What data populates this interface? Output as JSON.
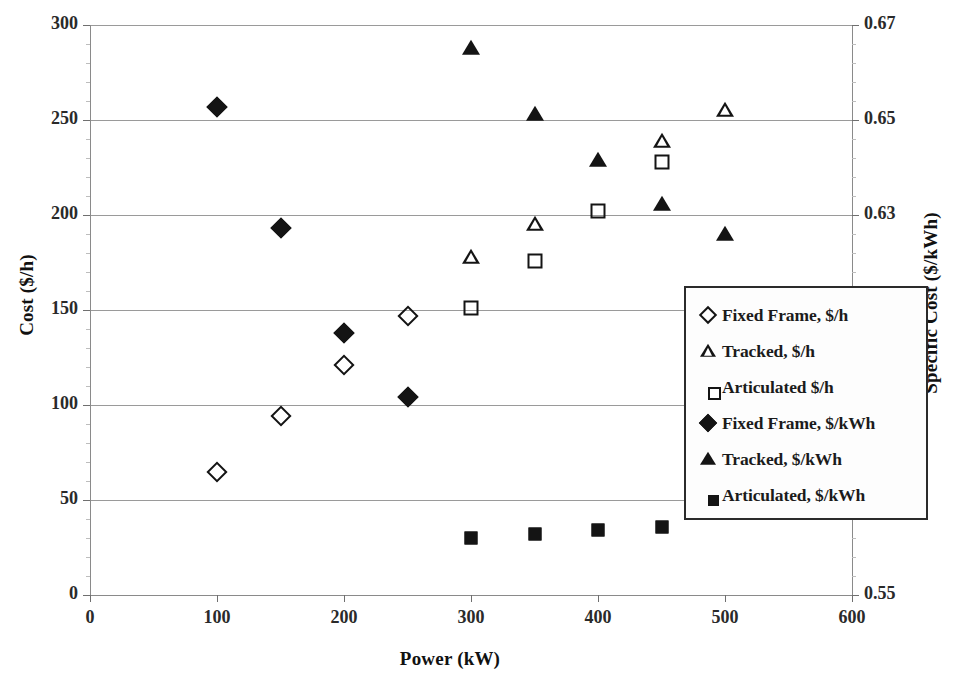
{
  "chart_data": {
    "type": "scatter",
    "title": "",
    "xlabel": "Power (kW)",
    "ylabel": "Cost ($/h)",
    "y2label": "Specific Cost ($/kWh)",
    "xlim": [
      0,
      600
    ],
    "ylim": [
      0,
      300
    ],
    "y2lim": [
      0.55,
      0.67
    ],
    "xticks": [
      0,
      100,
      200,
      300,
      400,
      500,
      600
    ],
    "yticks": [
      0,
      50,
      100,
      150,
      200,
      250,
      300
    ],
    "y2ticks": [
      0.55,
      0.57,
      0.59,
      0.61,
      0.63,
      0.65,
      0.67
    ],
    "grid": true,
    "legend_position": "center-right-inside",
    "series": [
      {
        "name": "Fixed Frame, $/h",
        "marker": "diamond-open",
        "axis": "left",
        "points": [
          {
            "x": 100,
            "y": 65
          },
          {
            "x": 150,
            "y": 94
          },
          {
            "x": 200,
            "y": 121
          },
          {
            "x": 250,
            "y": 147
          }
        ]
      },
      {
        "name": "Tracked, $/h",
        "marker": "triangle-open",
        "axis": "left",
        "points": [
          {
            "x": 300,
            "y": 178
          },
          {
            "x": 350,
            "y": 203
          },
          {
            "x": 450,
            "y": 255
          },
          {
            "x": 500,
            "y": 279
          }
        ]
      },
      {
        "name": "Articulated $/h",
        "marker": "square-open",
        "axis": "left",
        "points": [
          {
            "x": 300,
            "y": 151
          },
          {
            "x": 350,
            "y": 176
          },
          {
            "x": 400,
            "y": 202
          },
          {
            "x": 450,
            "y": 228
          }
        ]
      },
      {
        "name": "Fixed Frame, $/kWh",
        "marker": "diamond-filled",
        "axis": "right",
        "points": [
          {
            "x": 100,
            "y": 257,
            "y2": 0.6041
          },
          {
            "x": 150,
            "y": 193,
            "y2": 0.5906
          },
          {
            "x": 200,
            "y": 138,
            "y2": 0.5791
          },
          {
            "x": 250,
            "y": 104,
            "y2": 0.5719
          }
        ]
      },
      {
        "name": "Tracked, $/kWh",
        "marker": "triangle-filled",
        "axis": "right",
        "points": [
          {
            "x": 300,
            "y": 288,
            "y2": 0.6106
          },
          {
            "x": 350,
            "y": 253,
            "y2": 0.6032
          },
          {
            "x": 400,
            "y": 229,
            "y2": 0.5982
          },
          {
            "x": 450,
            "y": 206,
            "y2": 0.5933
          },
          {
            "x": 500,
            "y": 190,
            "y2": 0.59
          }
        ]
      },
      {
        "name": "Articulated, $/kWh",
        "marker": "square-filled",
        "axis": "right",
        "points": [
          {
            "x": 300,
            "y": 30,
            "y2": 0.5563
          },
          {
            "x": 350,
            "y": 32,
            "y2": 0.5568
          },
          {
            "x": 400,
            "y": 34,
            "y2": 0.5572
          },
          {
            "x": 450,
            "y": 36,
            "y2": 0.5576
          }
        ]
      }
    ]
  },
  "axes": {
    "left_title": "Cost ($/h)",
    "right_title": "Specific Cost ($/kWh)",
    "x_title": "Power (kW)",
    "left_ticks": [
      "300",
      "250",
      "200",
      "150",
      "100",
      "50",
      "0"
    ],
    "right_ticks": [
      "0.67",
      "0.65",
      "0.63",
      "0.61",
      "0.59",
      "0.57",
      "0.55"
    ],
    "x_ticks": [
      "0",
      "100",
      "200",
      "300",
      "400",
      "500",
      "600"
    ]
  },
  "legend": {
    "items": [
      {
        "label": "Fixed Frame, $/h",
        "marker": "diamond-open"
      },
      {
        "label": "Tracked, $/h",
        "marker": "triangle-open"
      },
      {
        "label": "Articulated $/h",
        "marker": "square-open"
      },
      {
        "label": "Fixed Frame, $/kWh",
        "marker": "diamond-filled"
      },
      {
        "label": "Tracked, $/kWh",
        "marker": "triangle-filled"
      },
      {
        "label": "Articulated, $/kWh",
        "marker": "square-filled"
      }
    ]
  }
}
